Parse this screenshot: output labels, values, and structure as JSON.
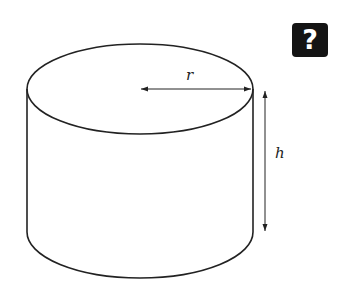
{
  "help_button": {
    "label": "?",
    "icon": "question-mark-icon"
  },
  "diagram": {
    "shape": "cylinder",
    "labels": {
      "radius": "r",
      "height": "h"
    },
    "colors": {
      "stroke": "#222222",
      "background": "#ffffff",
      "help_bg": "#141414",
      "help_fg": "#ffffff"
    }
  }
}
